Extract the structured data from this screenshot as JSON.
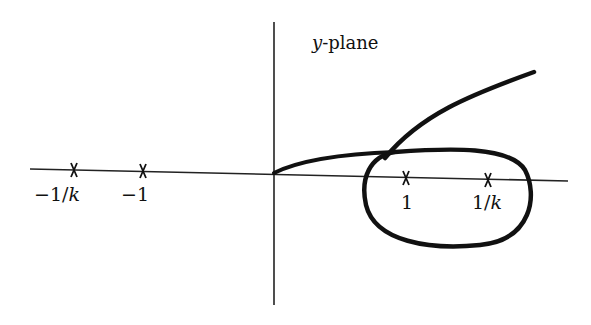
{
  "diagram": {
    "title_var": "y",
    "title_rest": "-plane",
    "colors": {
      "ink": "#111111",
      "background": "#ffffff"
    },
    "axes": {
      "horizontal": {
        "from": [
          30,
          169
        ],
        "to": [
          568,
          181
        ]
      },
      "vertical": {
        "from": [
          274,
          22
        ],
        "to": [
          274,
          305
        ]
      }
    },
    "markers": [
      {
        "id": "neg-inv-k",
        "label_main": "−1/",
        "label_italic": "k",
        "x": 74,
        "y": 170
      },
      {
        "id": "neg-one",
        "label_main": "−1",
        "label_italic": "",
        "x": 143,
        "y": 172
      },
      {
        "id": "one",
        "label_main": "1",
        "label_italic": "",
        "x": 406,
        "y": 178
      },
      {
        "id": "inv-k",
        "label_main": "1/",
        "label_italic": "k",
        "x": 488,
        "y": 180
      }
    ],
    "curves": [
      {
        "id": "open-branch",
        "description": "curve from origin through upper half, crossing into upper-right"
      },
      {
        "id": "closed-loop",
        "description": "closed loop enclosing points 1 and 1/k"
      }
    ]
  }
}
